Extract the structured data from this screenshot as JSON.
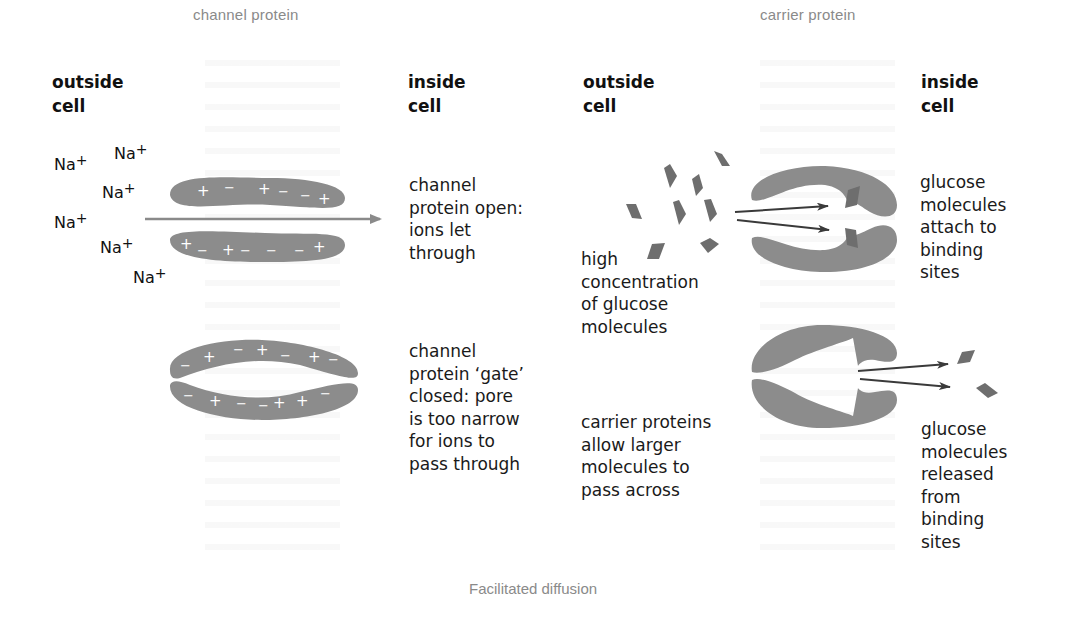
{
  "figure": {
    "caption": "Facilitated diffusion",
    "colors": {
      "protein": "#8c8c8c",
      "glucose": "#6e6e6e",
      "arrow": "#3a3a3a",
      "channel_arrow": "#8a8a8a",
      "title": "#8a8a8a"
    }
  },
  "channel": {
    "title": "channel protein",
    "outside_label": "outside\ncell",
    "inside_label": "inside\ncell",
    "ions": [
      {
        "symbol": "Na",
        "charge": "+"
      },
      {
        "symbol": "Na",
        "charge": "+"
      },
      {
        "symbol": "Na",
        "charge": "+"
      },
      {
        "symbol": "Na",
        "charge": "+"
      },
      {
        "symbol": "Na",
        "charge": "+"
      },
      {
        "symbol": "Na",
        "charge": "+"
      }
    ],
    "open_description": "channel\nprotein open:\nions let\nthrough",
    "closed_description": "channel\nprotein ‘gate’\nclosed: pore\nis too narrow\nfor ions to\npass through",
    "open_top_charges": "+  −   + −  − +",
    "open_bottom_charges": "+ −  + −  −  − +",
    "closed_top_charges": "− +  − + −  + −",
    "closed_bottom_charges": "−  + − − + + −"
  },
  "carrier": {
    "title": "carrier protein",
    "outside_label": "outside\ncell",
    "inside_label": "inside\ncell",
    "high_concentration": "high\nconcentration\nof glucose\nmolecules",
    "summary": "carrier proteins\nallow larger\nmolecules to\npass across",
    "attach_description": "glucose\nmolecules\nattach to\nbinding\nsites",
    "release_description": "glucose\nmolecules\nreleased\nfrom\nbinding\nsites"
  }
}
